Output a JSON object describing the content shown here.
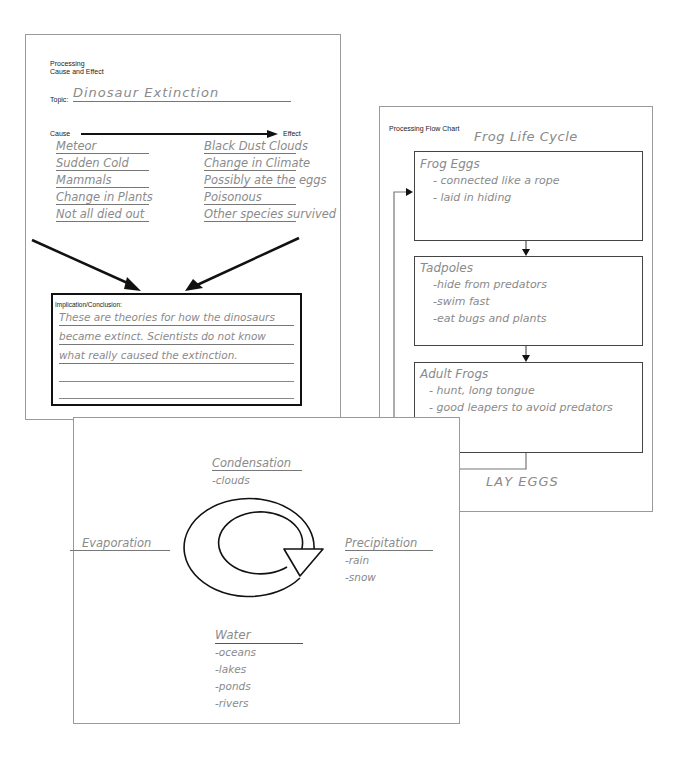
{
  "cause_effect": {
    "header_line1": "Processing",
    "header_line2": "Cause and Effect",
    "topic_label": "Topic:",
    "topic_value": "Dinosaur Extinction",
    "cause_label": "Cause",
    "effect_label": "Effect",
    "causes": [
      "Meteor",
      "Sudden Cold",
      "Mammals",
      "Change in Plants",
      "Not all died out"
    ],
    "effects": [
      "Black Dust Clouds",
      "Change in Climate",
      "Possibly ate the eggs",
      "Poisonous",
      "Other species survived"
    ],
    "conclusion_label": "Implication/Conclusion:",
    "conclusion_lines": [
      "These are theories for how the dinosaurs",
      "became extinct.  Scientists do not know",
      "what really caused the extinction."
    ]
  },
  "flow_chart": {
    "header": "Processing Flow Chart",
    "title": "Frog Life Cycle",
    "boxes": [
      {
        "title": "Frog Eggs",
        "items": [
          "- connected like a rope",
          "- laid in hiding"
        ]
      },
      {
        "title": "Tadpoles",
        "items": [
          "-hide from predators",
          "-swim fast",
          "-eat bugs and plants"
        ]
      },
      {
        "title": "Adult Frogs",
        "items": [
          "- hunt, long tongue",
          "- good leapers to avoid predators"
        ]
      }
    ],
    "loop_label": "LAY EGGS"
  },
  "water_cycle": {
    "condensation": {
      "title": "Condensation",
      "items": [
        "-clouds"
      ]
    },
    "evaporation": {
      "title": "Evaporation"
    },
    "precipitation": {
      "title": "Precipitation",
      "items": [
        "-rain",
        "-snow"
      ]
    },
    "water": {
      "title": "Water",
      "items": [
        "-oceans",
        "-lakes",
        "-ponds",
        "-rivers"
      ]
    }
  },
  "colors": {
    "handwriting": "#8a8a8a",
    "border": "#9a9a9a",
    "ink": "#222222"
  }
}
